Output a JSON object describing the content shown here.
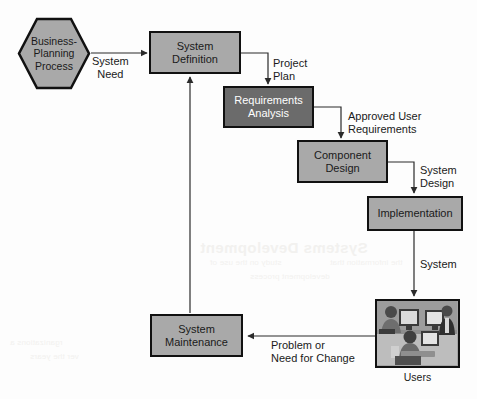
{
  "diagram": {
    "background_color": "#fdfdfd",
    "node_fill_light": "#a9a9a9",
    "node_fill_dark": "#6b6b6b",
    "node_border_color": "#111111",
    "edge_color": "#333333",
    "nodes": [
      {
        "id": "business-planning-process",
        "label": "Business-\nPlanning\nProcess",
        "line1": "Business-",
        "line2": "Planning",
        "line3": "Process",
        "shape": "hexagon",
        "fill": "#a9a9a9"
      },
      {
        "id": "system-definition",
        "label": "System Definition",
        "line1": "System",
        "line2": "Definition",
        "shape": "rectangle",
        "fill": "#a9a9a9"
      },
      {
        "id": "requirements-analysis",
        "label": "Requirements Analysis",
        "line1": "Requirements",
        "line2": "Analysis",
        "shape": "rectangle",
        "fill": "#6b6b6b"
      },
      {
        "id": "component-design",
        "label": "Component Design",
        "line1": "Component",
        "line2": "Design",
        "shape": "rectangle",
        "fill": "#a9a9a9"
      },
      {
        "id": "implementation",
        "label": "Implementation",
        "line1": "Implementation",
        "line2": "",
        "shape": "rectangle",
        "fill": "#a9a9a9"
      },
      {
        "id": "users",
        "label": "Users",
        "shape": "photo"
      },
      {
        "id": "system-maintenance",
        "label": "System Maintenance",
        "line1": "System",
        "line2": "Maintenance",
        "shape": "rectangle",
        "fill": "#a9a9a9"
      }
    ],
    "edges": [
      {
        "id": "system-need",
        "from": "business-planning-process",
        "to": "system-definition",
        "line1": "System",
        "line2": "Need"
      },
      {
        "id": "project-plan",
        "from": "system-definition",
        "to": "requirements-analysis",
        "line1": "Project",
        "line2": "Plan"
      },
      {
        "id": "approved-user-requirements",
        "from": "requirements-analysis",
        "to": "component-design",
        "line1": "Approved User",
        "line2": "Requirements"
      },
      {
        "id": "system-design",
        "from": "component-design",
        "to": "implementation",
        "line1": "System",
        "line2": "Design"
      },
      {
        "id": "system",
        "from": "implementation",
        "to": "users",
        "line1": "System",
        "line2": ""
      },
      {
        "id": "problem-or-need-for-change",
        "from": "users",
        "to": "system-maintenance",
        "line1": "Problem or",
        "line2": "Need for Change"
      },
      {
        "id": "maintenance-feedback",
        "from": "system-maintenance",
        "to": "system-definition",
        "line1": "",
        "line2": ""
      }
    ]
  },
  "bleed_through": {
    "heading": "Systems Development",
    "line_a": "study on the use of",
    "line_b": "the information that",
    "line_c": "development process",
    "line_d": "rganizations a",
    "line_e": "ver the years"
  }
}
